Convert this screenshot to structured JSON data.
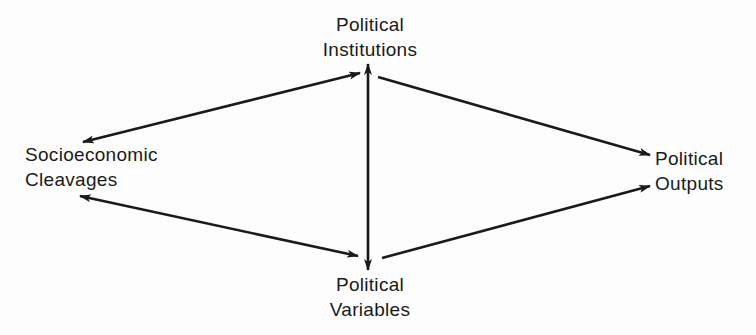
{
  "diagram": {
    "type": "flow-diagram",
    "nodes": {
      "institutions": {
        "line1": "Political",
        "line2": "Institutions"
      },
      "cleavages": {
        "line1": "Socioeconomic",
        "line2": "Cleavages"
      },
      "outputs": {
        "line1": "Political",
        "line2": "Outputs"
      },
      "variables": {
        "line1": "Political",
        "line2": "Variables"
      }
    },
    "edges": [
      {
        "from": "Socioeconomic Cleavages",
        "to": "Political Institutions",
        "direction": "bidirectional"
      },
      {
        "from": "Socioeconomic Cleavages",
        "to": "Political Variables",
        "direction": "bidirectional"
      },
      {
        "from": "Political Institutions",
        "to": "Political Variables",
        "direction": "bidirectional"
      },
      {
        "from": "Political Institutions",
        "to": "Political Outputs",
        "direction": "forward"
      },
      {
        "from": "Political Variables",
        "to": "Political Outputs",
        "direction": "forward"
      }
    ],
    "colors": {
      "ink": "#1a1a1a",
      "background": "#fdfdfd"
    }
  }
}
